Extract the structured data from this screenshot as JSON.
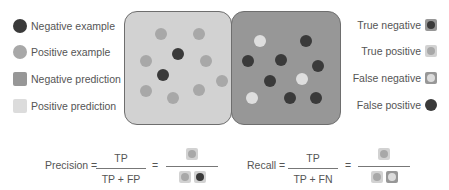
{
  "colors": {
    "negative_example": "#3a3a3a",
    "positive_example": "#a8a8a8",
    "negative_prediction": "#979797",
    "positive_prediction": "#d2d2d2",
    "box_border": "#6e6e6e"
  },
  "legend_left": [
    {
      "label": "Negative example",
      "icon": "dark-circle-icon"
    },
    {
      "label": "Positive example",
      "icon": "gray-circle-icon"
    },
    {
      "label": "Negative prediction",
      "icon": "dark-square-icon"
    },
    {
      "label": "Positive prediction",
      "icon": "light-square-icon"
    }
  ],
  "legend_right": [
    {
      "label": "True negative",
      "icon": "true-negative-icon"
    },
    {
      "label": "True positive",
      "icon": "true-positive-icon"
    },
    {
      "label": "False negative",
      "icon": "false-negative-icon"
    },
    {
      "label": "False positive",
      "icon": "false-positive-icon"
    }
  ],
  "regions": {
    "positive_prediction": {
      "dots": [
        {
          "x": 161,
          "y": 34,
          "type": "positive"
        },
        {
          "x": 199,
          "y": 34,
          "type": "positive"
        },
        {
          "x": 178,
          "y": 54,
          "type": "negative"
        },
        {
          "x": 146,
          "y": 61,
          "type": "positive"
        },
        {
          "x": 206,
          "y": 61,
          "type": "positive"
        },
        {
          "x": 163,
          "y": 75,
          "type": "negative"
        },
        {
          "x": 222,
          "y": 81,
          "type": "positive"
        },
        {
          "x": 146,
          "y": 91,
          "type": "positive"
        },
        {
          "x": 199,
          "y": 90,
          "type": "positive"
        },
        {
          "x": 173,
          "y": 98,
          "type": "positive"
        }
      ]
    },
    "negative_prediction": {
      "dots": [
        {
          "x": 260,
          "y": 41,
          "type": "positive"
        },
        {
          "x": 306,
          "y": 41,
          "type": "negative"
        },
        {
          "x": 248,
          "y": 61,
          "type": "negative"
        },
        {
          "x": 281,
          "y": 60,
          "type": "negative"
        },
        {
          "x": 318,
          "y": 66,
          "type": "negative"
        },
        {
          "x": 270,
          "y": 81,
          "type": "negative"
        },
        {
          "x": 302,
          "y": 79,
          "type": "positive"
        },
        {
          "x": 252,
          "y": 98,
          "type": "positive"
        },
        {
          "x": 290,
          "y": 98,
          "type": "negative"
        },
        {
          "x": 316,
          "y": 98,
          "type": "negative"
        }
      ]
    }
  },
  "formulas": {
    "precision": {
      "label": "Precision =",
      "numerator": "TP",
      "denominator": "TP + FP",
      "equals": "="
    },
    "recall": {
      "label": "Recall =",
      "numerator": "TP",
      "denominator": "TP + FN",
      "equals": "="
    }
  }
}
